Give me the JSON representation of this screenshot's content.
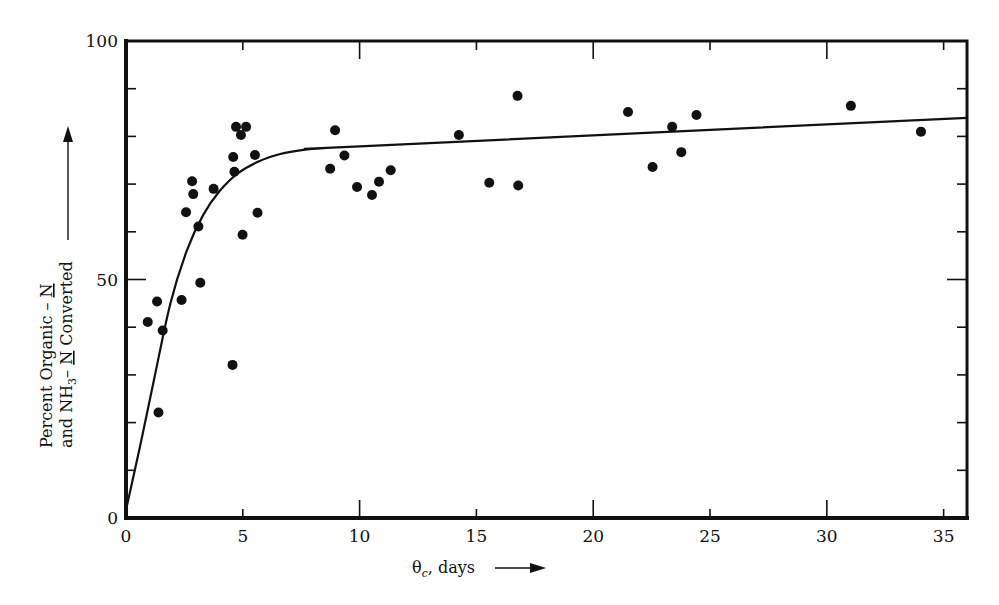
{
  "chart_data": {
    "type": "scatter",
    "title": "",
    "xlabel": "θc, days",
    "xlabel_main": "θ",
    "xlabel_sub": "c",
    "xlabel_rest": ", days",
    "ylabel_line1": "Percent Organic – N",
    "ylabel_line2": "and NH3– N Converted",
    "ylabel_line1_parts": {
      "text": "Percent Organic – ",
      "underlined": "N"
    },
    "ylabel_line2_parts": {
      "pre": "and NH",
      "sub": "3",
      "mid": "– ",
      "underlined": "N",
      "post": " Converted"
    },
    "xlim": [
      0,
      36
    ],
    "ylim": [
      0,
      100
    ],
    "x_ticks": [
      0,
      5,
      10,
      15,
      20,
      25,
      30,
      35
    ],
    "x_tick_labels": [
      "0",
      "5",
      "10",
      "15",
      "20",
      "25",
      "30",
      "35"
    ],
    "y_ticks_labeled": [
      0,
      50,
      100
    ],
    "y_tick_labels": [
      "0",
      "50",
      "100"
    ],
    "y_minor_ticks": [
      10,
      20,
      30,
      40,
      60,
      70,
      80,
      90
    ],
    "grid": false,
    "legend": "none",
    "series": [
      {
        "name": "observed",
        "kind": "points",
        "points": [
          [
            0.93,
            41.1
          ],
          [
            1.33,
            45.4
          ],
          [
            1.39,
            22.1
          ],
          [
            1.57,
            39.3
          ],
          [
            2.38,
            45.7
          ],
          [
            2.57,
            64.1
          ],
          [
            2.83,
            70.6
          ],
          [
            2.88,
            67.9
          ],
          [
            3.1,
            61.1
          ],
          [
            3.18,
            49.3
          ],
          [
            3.75,
            69.0
          ],
          [
            4.56,
            32.1
          ],
          [
            4.59,
            75.7
          ],
          [
            4.64,
            72.6
          ],
          [
            4.71,
            82.0
          ],
          [
            5.14,
            82.0
          ],
          [
            4.92,
            80.3
          ],
          [
            4.99,
            59.4
          ],
          [
            5.52,
            76.1
          ],
          [
            5.63,
            64.0
          ],
          [
            8.74,
            73.2
          ],
          [
            8.95,
            81.3
          ],
          [
            9.35,
            76.0
          ],
          [
            9.89,
            69.4
          ],
          [
            10.53,
            67.7
          ],
          [
            10.83,
            70.5
          ],
          [
            11.33,
            72.9
          ],
          [
            14.25,
            80.3
          ],
          [
            15.55,
            70.3
          ],
          [
            16.76,
            88.5
          ],
          [
            16.79,
            69.7
          ],
          [
            21.49,
            85.1
          ],
          [
            22.54,
            73.6
          ],
          [
            23.38,
            82.0
          ],
          [
            23.77,
            76.7
          ],
          [
            24.42,
            84.5
          ],
          [
            31.03,
            86.4
          ],
          [
            34.03,
            81.0
          ]
        ]
      },
      {
        "name": "fitted curve",
        "kind": "line",
        "points": [
          [
            0,
            1.7
          ],
          [
            0.6,
            15
          ],
          [
            1.2,
            29
          ],
          [
            1.9,
            45
          ],
          [
            2.6,
            56
          ],
          [
            3.3,
            63.5
          ],
          [
            4.0,
            68.5
          ],
          [
            4.8,
            72.3
          ],
          [
            5.7,
            74.8
          ],
          [
            6.6,
            76.3
          ],
          [
            7.6,
            77.2
          ],
          [
            8.6,
            77.6
          ],
          [
            10,
            77.9
          ],
          [
            36,
            83.9
          ]
        ]
      }
    ]
  }
}
